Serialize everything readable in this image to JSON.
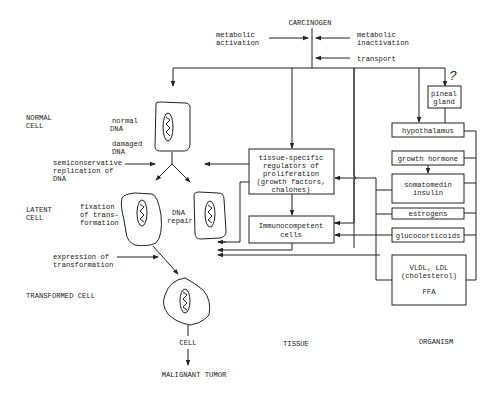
{
  "top": {
    "carcinogen": "CARCINOGEN",
    "metabolic_activation": [
      "metabolic",
      "activation"
    ],
    "metabolic_inactivation": [
      "metabolic",
      "inactivation"
    ],
    "transport": "transport",
    "question_mark": "?"
  },
  "left_labels": {
    "normal_cell": [
      "NORMAL",
      "CELL"
    ],
    "latent_cell": [
      "LATENT",
      "CELL"
    ],
    "transformed_cell": "TRANSFORMED CELL"
  },
  "cell_annotations": {
    "normal_dna": [
      "normal",
      "DNA"
    ],
    "damaged_dna": [
      "damaged",
      "DNA"
    ],
    "semiconservative": [
      "semiconservative",
      "replication of",
      "DNA"
    ],
    "fixation": [
      "fixation",
      "of trans-",
      "formation"
    ],
    "dna_repair": [
      "DNA",
      "repair"
    ],
    "expression": [
      "expression of",
      "transformation"
    ],
    "cell": "CELL",
    "malignant_tumor": "MALIGNANT TUMOR"
  },
  "tissue": {
    "regulators_box": [
      "tissue-specific",
      "regulators  of",
      "proliferation",
      "(growth factors,",
      "chalones)"
    ],
    "immuno_box": [
      "Immunocompetent",
      "cells"
    ],
    "column_label": "TISSUE"
  },
  "organism": {
    "pineal_gland": [
      "pineal",
      "gland"
    ],
    "hypothalamus": "hypothalamus",
    "growth_hormone": "growth hormone",
    "somatomedin": [
      "somatomedin",
      "insulin"
    ],
    "estrogens": "estrogens",
    "glucocorticoids": "glucocorticoids",
    "lipids": [
      "VLDL, LDL",
      "(cholesterol)",
      "",
      "FFA"
    ],
    "column_label": "ORGANISM"
  }
}
